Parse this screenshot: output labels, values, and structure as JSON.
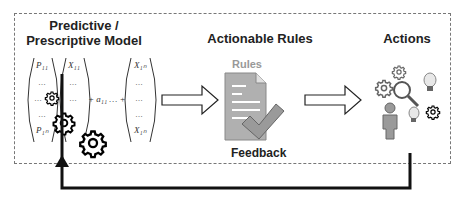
{
  "diagram": {
    "sections": [
      {
        "id": "model",
        "title_line1": "Predictive /",
        "title_line2": "Prescriptive Model"
      },
      {
        "id": "rules",
        "title": "Actionable Rules",
        "doc_label": "Rules",
        "caption": "Feedback"
      },
      {
        "id": "actions",
        "title": "Actions"
      }
    ],
    "matrix": {
      "p_top": "P₁₁",
      "p_bottom": "P₁ₙ",
      "x_top": "X₁₁",
      "x_end_top": "X₁ₙ",
      "x_end_bottom": "X₁ₙ",
      "ellipsis": "…",
      "operator": "+  a₁₁ … +"
    },
    "colors": {
      "border": "#777777",
      "text": "#222222",
      "doc": "#b0b0b0",
      "arrow": "#111111"
    }
  }
}
